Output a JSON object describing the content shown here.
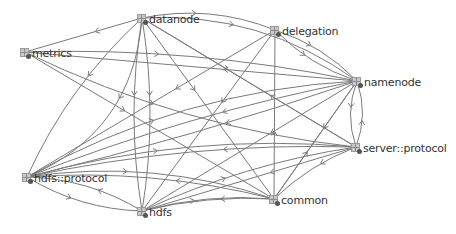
{
  "diagram": {
    "type": "package-dependency-graph",
    "edge_color": "#7a7a7a",
    "nodes": [
      {
        "id": "datanode",
        "label": "datanode",
        "x": 137,
        "y": 12
      },
      {
        "id": "metrics",
        "label": "metrics",
        "x": 20,
        "y": 46
      },
      {
        "id": "delegation",
        "label": "delegation",
        "x": 270,
        "y": 24
      },
      {
        "id": "namenode",
        "label": "namenode",
        "x": 352,
        "y": 75
      },
      {
        "id": "server_protocol",
        "label": "server::protocol",
        "x": 351,
        "y": 141
      },
      {
        "id": "common",
        "label": "common",
        "x": 269,
        "y": 193
      },
      {
        "id": "hdfs",
        "label": "hdfs",
        "x": 137,
        "y": 205
      },
      {
        "id": "hdfs_protocol",
        "label": "hdfs::protocol",
        "x": 22,
        "y": 171
      }
    ],
    "edges": [
      {
        "from": "datanode",
        "to": "metrics",
        "bend": 0
      },
      {
        "from": "datanode",
        "to": "delegation",
        "bend": -10
      },
      {
        "from": "datanode",
        "to": "namenode",
        "bend": -20
      },
      {
        "from": "datanode",
        "to": "server_protocol",
        "bend": 0
      },
      {
        "from": "datanode",
        "to": "common",
        "bend": 0
      },
      {
        "from": "datanode",
        "to": "hdfs",
        "bend": 8
      },
      {
        "from": "datanode",
        "to": "hdfs",
        "bend": -8
      },
      {
        "from": "datanode",
        "to": "hdfs_protocol",
        "bend": 10
      },
      {
        "from": "datanode",
        "to": "hdfs_protocol",
        "bend": -30
      },
      {
        "from": "metrics",
        "to": "namenode",
        "bend": -10
      },
      {
        "from": "metrics",
        "to": "server_protocol",
        "bend": 15
      },
      {
        "from": "metrics",
        "to": "common",
        "bend": 0
      },
      {
        "from": "delegation",
        "to": "hdfs_protocol",
        "bend": 0
      },
      {
        "from": "delegation",
        "to": "hdfs",
        "bend": 0
      },
      {
        "from": "delegation",
        "to": "namenode",
        "bend": -6
      },
      {
        "from": "delegation",
        "to": "namenode",
        "bend": 6
      },
      {
        "from": "namenode",
        "to": "hdfs_protocol",
        "bend": 8
      },
      {
        "from": "namenode",
        "to": "hdfs_protocol",
        "bend": -4
      },
      {
        "from": "namenode",
        "to": "hdfs",
        "bend": 0
      },
      {
        "from": "namenode",
        "to": "common",
        "bend": 0
      },
      {
        "from": "namenode",
        "to": "server_protocol",
        "bend": 6
      },
      {
        "from": "server_protocol",
        "to": "namenode",
        "bend": 6
      },
      {
        "from": "namenode",
        "to": "metrics",
        "bend": 0
      },
      {
        "from": "server_protocol",
        "to": "hdfs_protocol",
        "bend": 10
      },
      {
        "from": "server_protocol",
        "to": "hdfs",
        "bend": 0
      },
      {
        "from": "server_protocol",
        "to": "common",
        "bend": 5
      },
      {
        "from": "server_protocol",
        "to": "datanode",
        "bend": 0
      },
      {
        "from": "common",
        "to": "hdfs_protocol",
        "bend": 10
      },
      {
        "from": "common",
        "to": "hdfs",
        "bend": 5
      },
      {
        "from": "common",
        "to": "delegation",
        "bend": 0
      },
      {
        "from": "common",
        "to": "namenode",
        "bend": 0
      },
      {
        "from": "hdfs",
        "to": "hdfs_protocol",
        "bend": 8
      },
      {
        "from": "hdfs_protocol",
        "to": "hdfs",
        "bend": 8
      },
      {
        "from": "hdfs",
        "to": "server_protocol",
        "bend": -8
      },
      {
        "from": "hdfs",
        "to": "common",
        "bend": -6
      },
      {
        "from": "hdfs_protocol",
        "to": "server_protocol",
        "bend": -15
      },
      {
        "from": "hdfs_protocol",
        "to": "common",
        "bend": -15
      },
      {
        "from": "hdfs_protocol",
        "to": "namenode",
        "bend": -20
      }
    ]
  }
}
